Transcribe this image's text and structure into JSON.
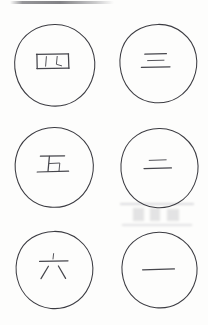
{
  "document": {
    "kind": "handwriting-worksheet",
    "medium": "scanned paper",
    "background_color": "#fdfdfc",
    "ink_color": "#3c3c42",
    "grid": {
      "columns": 2,
      "rows": 3,
      "total_circles": 6
    }
  },
  "artifacts": {
    "top_smudge_label": "scan smudge",
    "ghost_marks_label": "faint bleed-through marks"
  },
  "circles": [
    {
      "id": "circle-1",
      "position": {
        "row": 1,
        "column": 1
      },
      "character": "四",
      "reading": "si",
      "meaning": "four",
      "value": 4
    },
    {
      "id": "circle-2",
      "position": {
        "row": 1,
        "column": 2
      },
      "character": "三",
      "reading": "san",
      "meaning": "three",
      "value": 3
    },
    {
      "id": "circle-3",
      "position": {
        "row": 2,
        "column": 1
      },
      "character": "五",
      "reading": "wu",
      "meaning": "five",
      "value": 5
    },
    {
      "id": "circle-4",
      "position": {
        "row": 2,
        "column": 2
      },
      "character": "二",
      "reading": "er",
      "meaning": "two",
      "value": 2
    },
    {
      "id": "circle-5",
      "position": {
        "row": 3,
        "column": 1
      },
      "character": "六",
      "reading": "liu",
      "meaning": "six",
      "value": 6
    },
    {
      "id": "circle-6",
      "position": {
        "row": 3,
        "column": 2
      },
      "character": "一",
      "reading": "yi",
      "meaning": "one",
      "value": 1
    }
  ]
}
